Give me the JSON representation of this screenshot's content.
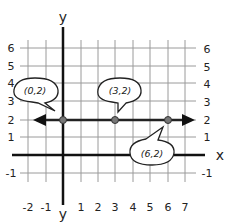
{
  "diagram": {
    "type": "coordinate-plane",
    "x_axis_label": "x",
    "y_axis_label_top": "y",
    "y_axis_label_bottom": "y",
    "x_ticks": [
      "-2",
      "-1",
      "1",
      "2",
      "3",
      "4",
      "5",
      "6",
      "7"
    ],
    "y_ticks_left": [
      "6",
      "5",
      "4",
      "3",
      "2",
      "1",
      "-1"
    ],
    "y_ticks_right": [
      "6",
      "5",
      "4",
      "3",
      "2",
      "1",
      "-1"
    ],
    "line": {
      "equation": "y = 2",
      "direction": "horizontal",
      "arrows": "both"
    },
    "points": [
      {
        "label": "(0,2)",
        "x": 0,
        "y": 2
      },
      {
        "label": "(3,2)",
        "x": 3,
        "y": 2
      },
      {
        "label": "(6,2)",
        "x": 6,
        "y": 2
      }
    ],
    "colors": {
      "grid": "#999999",
      "axis": "#111111",
      "line": "#222222",
      "point": "#777777"
    }
  }
}
